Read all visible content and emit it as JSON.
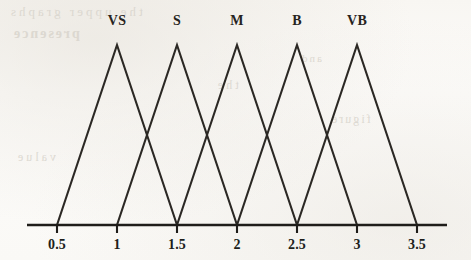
{
  "figure": {
    "kind": "fuzzy-membership-function-plot",
    "background_color": "#fbfaf8",
    "stroke_color": "#2b2824",
    "axis_color": "#1f1d1a"
  },
  "bleed_through_text": {
    "line1": "the upper graphs",
    "line2": "presence",
    "line3": "and",
    "line4": "the",
    "line5": "figure",
    "line6": "value"
  },
  "chart_data": {
    "type": "line",
    "title": "",
    "xlabel": "",
    "ylabel": "",
    "xlim": [
      0.25,
      3.75
    ],
    "ylim": [
      0,
      1
    ],
    "grid": false,
    "legend_position": "above-peaks",
    "x_ticks": [
      "0.5",
      "1",
      "1.5",
      "2",
      "2.5",
      "3",
      "3.5"
    ],
    "x_tick_values": [
      0.5,
      1,
      1.5,
      2,
      2.5,
      3,
      3.5
    ],
    "axis_start": 0.25,
    "axis_end": 3.75,
    "series": [
      {
        "name": "VS",
        "label": "VS",
        "shape": "triangular",
        "left": 0.5,
        "peak": 1,
        "right": 1.5,
        "x": [
          0.5,
          1,
          1.5
        ],
        "values": [
          0,
          1,
          0
        ]
      },
      {
        "name": "S",
        "label": "S",
        "shape": "triangular",
        "left": 1,
        "peak": 1.5,
        "right": 2,
        "x": [
          1,
          1.5,
          2
        ],
        "values": [
          0,
          1,
          0
        ]
      },
      {
        "name": "M",
        "label": "M",
        "shape": "triangular",
        "left": 1.5,
        "peak": 2,
        "right": 2.5,
        "x": [
          1.5,
          2,
          2.5
        ],
        "values": [
          0,
          1,
          0
        ]
      },
      {
        "name": "B",
        "label": "B",
        "shape": "triangular",
        "left": 2,
        "peak": 2.5,
        "right": 3,
        "x": [
          2,
          2.5,
          3
        ],
        "values": [
          0,
          1,
          0
        ]
      },
      {
        "name": "VB",
        "label": "VB",
        "shape": "triangular",
        "left": 2.5,
        "peak": 3,
        "right": 3.5,
        "x": [
          2.5,
          3,
          3.5
        ],
        "values": [
          0,
          1,
          0
        ]
      }
    ]
  }
}
